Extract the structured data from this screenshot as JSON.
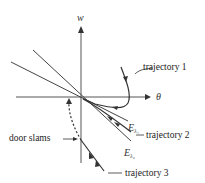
{
  "diagram": {
    "axes": {
      "x_label": "θ",
      "y_label": "w"
    },
    "eigenlines": [
      {
        "label": "E",
        "subscript": "λ₁"
      },
      {
        "label": "E",
        "subscript": "λ₂"
      }
    ],
    "annotations": {
      "trajectory_1": "trajectory 1",
      "trajectory_2": "trajectory 2",
      "trajectory_3": "trajectory 3",
      "door_slams": "door slams"
    },
    "colors": {
      "ink": "#333333",
      "background": "#ffffff"
    }
  }
}
